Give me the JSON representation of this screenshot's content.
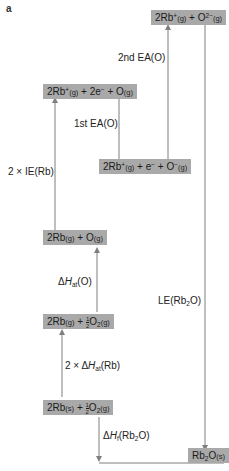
{
  "figure": {
    "panel_label": "a",
    "line_color": "#7f7f7f",
    "box_color": "#a9a9a9"
  },
  "levels": {
    "top": {
      "a": "2Rb",
      "a_sup": "+",
      "a_state": "(g)",
      "plus": " + O",
      "b_sup": "2−",
      "b_state": "(g)"
    },
    "ionized": {
      "a": "2Rb",
      "a_sup": "+",
      "a_state": "(g)",
      "mid": " + 2e",
      "e_sup": "−",
      "plus": " + O",
      "b_state": "(g)"
    },
    "first_ea": {
      "a": "2Rb",
      "a_sup": "+",
      "a_state": "(g)",
      "mid": " + e",
      "e_sup": "−",
      "plus": " + O",
      "b_sup": "−",
      "b_state": "(g)"
    },
    "atoms": {
      "a": "2Rb",
      "a_state": "(g)",
      "plus": " + O",
      "b_state": "(g)"
    },
    "rb_gas": {
      "a": "2Rb",
      "a_state": "(g)",
      "plus": " + ",
      "frac_n": "1",
      "frac_d": "2",
      "o": "O",
      "o_sub": "2",
      "b_state": "(g)"
    },
    "elements": {
      "a": "2Rb",
      "a_state": "(s)",
      "plus": " + ",
      "frac_n": "1",
      "frac_d": "2",
      "o": "O",
      "o_sub": "2",
      "b_state": "(g)"
    },
    "product": {
      "a": "Rb",
      "a_sub": "2",
      "o": "O",
      "b_state": "(s)"
    }
  },
  "steps": {
    "second_ea": "2nd EA(O)",
    "first_ea": "1st EA(O)",
    "ie": "2 × IE(Rb)",
    "hat_o": {
      "prefix": "Δ",
      "H": "H",
      "sub": "at",
      "suffix": "(O)"
    },
    "hat_rb": {
      "prefix": "2 × Δ",
      "H": "H",
      "sub": "at",
      "suffix": "(Rb)"
    },
    "hf": {
      "prefix": "Δ",
      "H": "H",
      "sub": "f",
      "suffix": "(Rb",
      "sub2": "2",
      "suffix2": "O)"
    },
    "le": {
      "prefix": "LE(Rb",
      "sub": "2",
      "suffix": "O)"
    }
  }
}
